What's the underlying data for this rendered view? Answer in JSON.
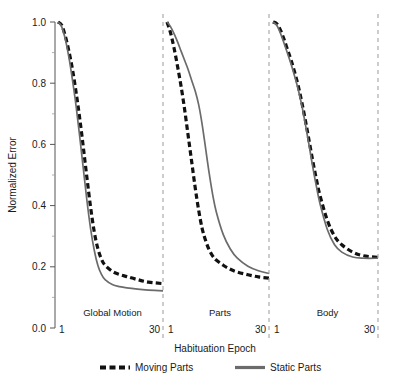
{
  "chart_data": {
    "type": "line",
    "title": "",
    "xlabel": "Habituation Epoch",
    "ylabel": "Normalized Error",
    "ylim": [
      0.0,
      1.0
    ],
    "xlim": [
      1,
      30
    ],
    "grid": false,
    "legend_position": "bottom",
    "ytick_labels": [
      "0.0",
      "0.2",
      "0.4",
      "0.6",
      "0.8",
      "1.0"
    ],
    "ytick_values": [
      0.0,
      0.2,
      0.4,
      0.6,
      0.8,
      1.0
    ],
    "yminor_values": [
      0.1,
      0.3,
      0.5,
      0.7,
      0.9
    ],
    "xtick_labels": [
      "1",
      "30"
    ],
    "xtick_values": [
      1,
      30
    ],
    "panels": [
      {
        "name": "Global Motion",
        "label": "Global Motion",
        "x": [
          1,
          2,
          3,
          4,
          5,
          6,
          7,
          8,
          9,
          10,
          11,
          12,
          13,
          14,
          16,
          18,
          20,
          23,
          26,
          30
        ],
        "series": [
          {
            "name": "Moving Parts",
            "style": "dashed",
            "color": "#111111",
            "values": [
              1.0,
              0.99,
              0.955,
              0.905,
              0.845,
              0.77,
              0.685,
              0.59,
              0.49,
              0.395,
              0.315,
              0.26,
              0.225,
              0.205,
              0.185,
              0.175,
              0.168,
              0.158,
              0.15,
              0.145
            ]
          },
          {
            "name": "Static Parts",
            "style": "solid",
            "color": "#6b6b6b",
            "values": [
              1.0,
              0.985,
              0.945,
              0.885,
              0.81,
              0.725,
              0.625,
              0.52,
              0.415,
              0.325,
              0.255,
              0.205,
              0.175,
              0.158,
              0.142,
              0.135,
              0.131,
              0.127,
              0.124,
              0.121
            ]
          }
        ]
      },
      {
        "name": "Parts",
        "label": "Parts",
        "x": [
          1,
          2,
          3,
          4,
          5,
          6,
          7,
          8,
          9,
          10,
          11,
          12,
          13,
          14,
          15,
          17,
          19,
          21,
          24,
          27,
          30
        ],
        "series": [
          {
            "name": "Moving Parts",
            "style": "dashed",
            "color": "#111111",
            "values": [
              1.0,
              0.965,
              0.915,
              0.855,
              0.79,
              0.715,
              0.63,
              0.545,
              0.46,
              0.385,
              0.325,
              0.285,
              0.255,
              0.235,
              0.222,
              0.205,
              0.192,
              0.183,
              0.174,
              0.167,
              0.163
            ]
          },
          {
            "name": "Static Parts",
            "style": "solid",
            "color": "#6b6b6b",
            "values": [
              1.0,
              0.985,
              0.962,
              0.935,
              0.905,
              0.875,
              0.845,
              0.81,
              0.775,
              0.73,
              0.665,
              0.585,
              0.505,
              0.435,
              0.38,
              0.305,
              0.258,
              0.228,
              0.202,
              0.187,
              0.178
            ]
          }
        ]
      },
      {
        "name": "Body",
        "label": "Body",
        "x": [
          1,
          2,
          3,
          4,
          5,
          6,
          7,
          8,
          9,
          10,
          11,
          12,
          13,
          14,
          16,
          18,
          20,
          23,
          26,
          30
        ],
        "series": [
          {
            "name": "Moving Parts",
            "style": "dashed",
            "color": "#111111",
            "values": [
              1.0,
              0.995,
              0.975,
              0.945,
              0.91,
              0.875,
              0.835,
              0.79,
              0.735,
              0.675,
              0.61,
              0.545,
              0.485,
              0.432,
              0.352,
              0.3,
              0.272,
              0.248,
              0.236,
              0.231
            ]
          },
          {
            "name": "Static Parts",
            "style": "solid",
            "color": "#6b6b6b",
            "values": [
              1.0,
              0.99,
              0.965,
              0.932,
              0.898,
              0.862,
              0.822,
              0.778,
              0.725,
              0.662,
              0.595,
              0.525,
              0.462,
              0.405,
              0.322,
              0.272,
              0.248,
              0.232,
              0.228,
              0.228
            ]
          }
        ]
      }
    ],
    "legend": [
      {
        "label": "Moving Parts",
        "style": "dashed",
        "color": "#111111"
      },
      {
        "label": "Static Parts",
        "style": "solid",
        "color": "#6b6b6b"
      }
    ]
  },
  "axis": {
    "y_title": "Normalized Error",
    "x_title": "Habituation Epoch"
  },
  "colors": {
    "moving": "#111111",
    "static": "#6b6b6b",
    "separator": "#9a9a9a",
    "axis": "#555555"
  }
}
